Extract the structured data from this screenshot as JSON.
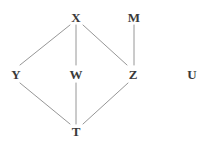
{
  "graph": {
    "title": "Hasse diagram",
    "background_color": "#ffffff",
    "edge_color": "#8a8a8a",
    "label_color": "#3a3a3a",
    "nodes": [
      {
        "id": "X",
        "label": "X",
        "x": 76,
        "y": 17
      },
      {
        "id": "M",
        "label": "M",
        "x": 134,
        "y": 17
      },
      {
        "id": "Y",
        "label": "Y",
        "x": 16,
        "y": 74
      },
      {
        "id": "W",
        "label": "W",
        "x": 76,
        "y": 74
      },
      {
        "id": "Z",
        "label": "Z",
        "x": 133,
        "y": 74
      },
      {
        "id": "U",
        "label": "U",
        "x": 192,
        "y": 74
      },
      {
        "id": "T",
        "label": "T",
        "x": 76,
        "y": 131
      }
    ],
    "edges": [
      {
        "from": "X",
        "to": "Y",
        "x1": 70,
        "y1": 25,
        "x2": 20,
        "y2": 65
      },
      {
        "from": "X",
        "to": "W",
        "x1": 76,
        "y1": 25,
        "x2": 76,
        "y2": 65
      },
      {
        "from": "X",
        "to": "Z",
        "x1": 83,
        "y1": 25,
        "x2": 127,
        "y2": 65
      },
      {
        "from": "M",
        "to": "Z",
        "x1": 134,
        "y1": 25,
        "x2": 134,
        "y2": 65
      },
      {
        "from": "Y",
        "to": "T",
        "x1": 20,
        "y1": 83,
        "x2": 70,
        "y2": 124
      },
      {
        "from": "W",
        "to": "T",
        "x1": 76,
        "y1": 83,
        "x2": 76,
        "y2": 124
      },
      {
        "from": "Z",
        "to": "T",
        "x1": 128,
        "y1": 83,
        "x2": 83,
        "y2": 124
      }
    ],
    "isolated_nodes": [
      "U"
    ]
  }
}
